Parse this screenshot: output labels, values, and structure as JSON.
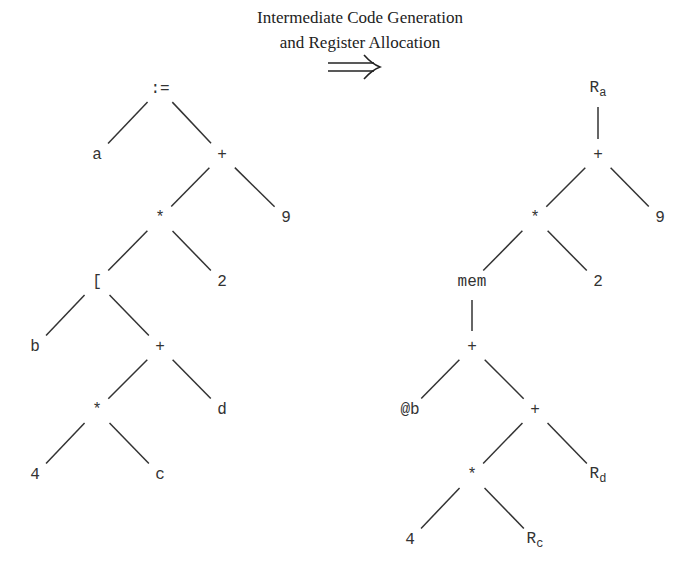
{
  "caption": {
    "line1": "Intermediate Code Generation",
    "line2": "and Register Allocation",
    "arrow": "⟹"
  },
  "left_tree": {
    "nodes": [
      {
        "id": "assign",
        "label": ":=",
        "x": 160,
        "y": 89
      },
      {
        "id": "a",
        "label": "a",
        "x": 97,
        "y": 155
      },
      {
        "id": "plus1",
        "label": "+",
        "x": 222,
        "y": 155
      },
      {
        "id": "mul1",
        "label": "*",
        "x": 160,
        "y": 218
      },
      {
        "id": "nine",
        "label": "9",
        "x": 286,
        "y": 218
      },
      {
        "id": "index",
        "label": "[",
        "x": 97,
        "y": 282
      },
      {
        "id": "two",
        "label": "2",
        "x": 222,
        "y": 282
      },
      {
        "id": "b",
        "label": "b",
        "x": 35,
        "y": 347
      },
      {
        "id": "plus2",
        "label": "+",
        "x": 160,
        "y": 347
      },
      {
        "id": "mul2",
        "label": "*",
        "x": 97,
        "y": 410
      },
      {
        "id": "d",
        "label": "d",
        "x": 222,
        "y": 410
      },
      {
        "id": "four",
        "label": "4",
        "x": 35,
        "y": 475
      },
      {
        "id": "c",
        "label": "c",
        "x": 160,
        "y": 475
      }
    ],
    "edges": [
      [
        "assign",
        "a"
      ],
      [
        "assign",
        "plus1"
      ],
      [
        "plus1",
        "mul1"
      ],
      [
        "plus1",
        "nine"
      ],
      [
        "mul1",
        "index"
      ],
      [
        "mul1",
        "two"
      ],
      [
        "index",
        "b"
      ],
      [
        "index",
        "plus2"
      ],
      [
        "plus2",
        "mul2"
      ],
      [
        "plus2",
        "d"
      ],
      [
        "mul2",
        "four"
      ],
      [
        "mul2",
        "c"
      ]
    ]
  },
  "right_tree": {
    "nodes": [
      {
        "id": "ra",
        "label": "R",
        "sub": "a",
        "x": 598,
        "y": 89
      },
      {
        "id": "plus1",
        "label": "+",
        "x": 598,
        "y": 155
      },
      {
        "id": "mul1",
        "label": "*",
        "x": 535,
        "y": 218
      },
      {
        "id": "nine",
        "label": "9",
        "x": 660,
        "y": 218
      },
      {
        "id": "mem",
        "label": "mem",
        "x": 472,
        "y": 282
      },
      {
        "id": "two",
        "label": "2",
        "x": 598,
        "y": 282
      },
      {
        "id": "plus2",
        "label": "+",
        "x": 472,
        "y": 347
      },
      {
        "id": "atb",
        "label": "@b",
        "x": 410,
        "y": 410
      },
      {
        "id": "plus3",
        "label": "+",
        "x": 535,
        "y": 410
      },
      {
        "id": "mul2",
        "label": "*",
        "x": 472,
        "y": 475
      },
      {
        "id": "rd",
        "label": "R",
        "sub": "d",
        "x": 598,
        "y": 475
      },
      {
        "id": "four",
        "label": "4",
        "x": 410,
        "y": 540
      },
      {
        "id": "rc",
        "label": "R",
        "sub": "c",
        "x": 535,
        "y": 540
      }
    ],
    "edges": [
      [
        "ra",
        "plus1"
      ],
      [
        "plus1",
        "mul1"
      ],
      [
        "plus1",
        "nine"
      ],
      [
        "mul1",
        "mem"
      ],
      [
        "mul1",
        "two"
      ],
      [
        "mem",
        "plus2"
      ],
      [
        "plus2",
        "atb"
      ],
      [
        "plus2",
        "plus3"
      ],
      [
        "plus3",
        "mul2"
      ],
      [
        "plus3",
        "rd"
      ],
      [
        "mul2",
        "four"
      ],
      [
        "mul2",
        "rc"
      ]
    ]
  }
}
